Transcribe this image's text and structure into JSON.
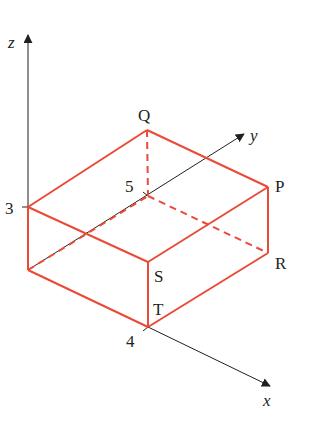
{
  "colors": {
    "box": "#ea4a38",
    "axis": "#231f20",
    "background": "#ffffff"
  },
  "axes": {
    "x": {
      "label": "x",
      "from": [
        148,
        327
      ],
      "to": [
        272,
        387
      ]
    },
    "y": {
      "label": "y",
      "from": [
        28,
        270
      ],
      "to": [
        246,
        133
      ]
    },
    "z": {
      "label": "z",
      "from": [
        28,
        270
      ],
      "to": [
        28,
        33
      ]
    }
  },
  "ticks": {
    "z3": {
      "label": "3"
    },
    "y5": {
      "label": "5"
    },
    "x4": {
      "label": "4"
    }
  },
  "vertices": {
    "Q": {
      "label": "Q"
    },
    "P": {
      "label": "P"
    },
    "R": {
      "label": "R"
    },
    "S": {
      "label": "S"
    },
    "T": {
      "label": "T"
    }
  }
}
